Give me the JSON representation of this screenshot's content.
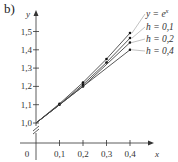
{
  "panel_label": "b)",
  "chart_data": {
    "type": "line",
    "title": "",
    "xlabel": "x",
    "ylabel": "y",
    "x_ticks": [
      "0",
      "0,1",
      "0,2",
      "0,3",
      "0,4"
    ],
    "y_ticks": [
      "1,0",
      "1,1",
      "1,2",
      "1,3",
      "1,4",
      "1,5"
    ],
    "xlim": [
      0,
      0.4
    ],
    "ylim": [
      1.0,
      1.55
    ],
    "grid": false,
    "axis_break_on_y": true,
    "legend_position": "right (leader-line labels)",
    "series": [
      {
        "name": "y = e^x",
        "x": [
          0,
          0.1,
          0.2,
          0.3,
          0.4
        ],
        "y": [
          1.0,
          1.1052,
          1.2214,
          1.3499,
          1.4918
        ]
      },
      {
        "name": "h = 0,1",
        "x": [
          0,
          0.1,
          0.2,
          0.3,
          0.4
        ],
        "y": [
          1.0,
          1.1,
          1.21,
          1.331,
          1.4641
        ]
      },
      {
        "name": "h = 0,2",
        "x": [
          0,
          0.2,
          0.4
        ],
        "y": [
          1.0,
          1.2,
          1.44
        ]
      },
      {
        "name": "h = 0,4",
        "x": [
          0,
          0.4
        ],
        "y": [
          1.0,
          1.4
        ]
      }
    ]
  },
  "colors": {
    "line": "#444444",
    "axis": "#333333",
    "leader": "#999999"
  }
}
